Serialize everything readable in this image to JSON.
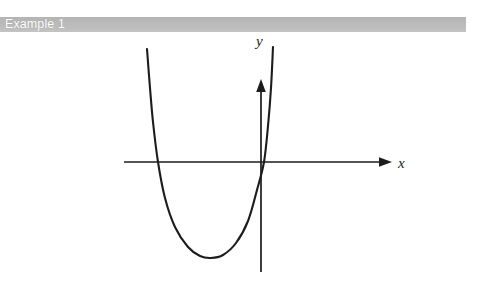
{
  "page": {
    "background_color": "#ffffff",
    "width": 477,
    "height": 289
  },
  "header": {
    "title": "Example 1",
    "band_color": "#bdbdbd",
    "text_color": "#ffffff"
  },
  "figure": {
    "name": "upward-opening-parabola-graph",
    "stroke_color": "#1c1c1c",
    "axes": {
      "x_axis": {
        "label": "x",
        "arrow": "right",
        "y_pixel": 162,
        "x_start_pixel": 124,
        "x_end_pixel": 392
      },
      "y_axis": {
        "label": "y",
        "arrow": "up",
        "x_pixel": 261,
        "y_top_pixel": 47,
        "y_bottom_pixel": 272
      }
    }
  },
  "chart_data": {
    "type": "line",
    "title": "",
    "subtitle": "",
    "xlabel": "x",
    "ylabel": "y",
    "grid": false,
    "legend": null,
    "annotations": [],
    "axis_arrows": {
      "x": "right",
      "y": "up"
    },
    "origin_pixel": {
      "x": 261,
      "y": 162
    },
    "series": [
      {
        "name": "parabola",
        "shape": "upward-opening parabola",
        "roots_pixel_x": [
          158,
          264
        ],
        "vertex_pixel": {
          "x": 211,
          "y": 258
        },
        "endpoints_pixel": [
          {
            "x": 147,
            "y": 49
          },
          {
            "x": 273,
            "y": 47
          }
        ],
        "points_pixel": [
          {
            "x": 147,
            "y": 49
          },
          {
            "x": 150,
            "y": 88
          },
          {
            "x": 153,
            "y": 122
          },
          {
            "x": 158,
            "y": 162
          },
          {
            "x": 165,
            "y": 198
          },
          {
            "x": 175,
            "y": 227
          },
          {
            "x": 188,
            "y": 247
          },
          {
            "x": 200,
            "y": 256
          },
          {
            "x": 211,
            "y": 258
          },
          {
            "x": 223,
            "y": 255
          },
          {
            "x": 236,
            "y": 243
          },
          {
            "x": 248,
            "y": 221
          },
          {
            "x": 257,
            "y": 190
          },
          {
            "x": 264,
            "y": 162
          },
          {
            "x": 268,
            "y": 126
          },
          {
            "x": 271,
            "y": 88
          },
          {
            "x": 273,
            "y": 47
          }
        ]
      }
    ]
  }
}
